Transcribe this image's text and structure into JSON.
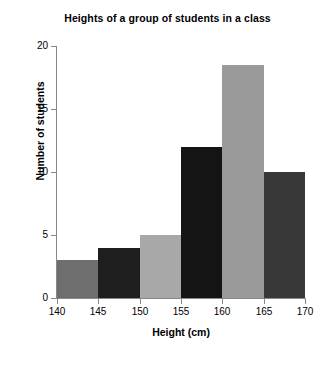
{
  "chart_data": {
    "type": "bar",
    "title": "Heights of a group of students in a class",
    "xlabel": "Height (cm)",
    "ylabel": "Number of students",
    "grid": false,
    "legend": "none",
    "xlim": [
      140,
      170
    ],
    "ylim": [
      0,
      20
    ],
    "xticks": [
      "140",
      "145",
      "150",
      "155",
      "160",
      "165",
      "170"
    ],
    "yticks": [
      "0",
      "5",
      "10",
      "15",
      "20"
    ],
    "bin_width": 5,
    "categories": [
      "140-145",
      "145-150",
      "150-155",
      "155-160",
      "160-165",
      "165-170"
    ],
    "values": [
      3,
      4,
      5,
      12,
      18.5,
      10
    ],
    "bin_edges": [
      140,
      145,
      150,
      155,
      160,
      165,
      170
    ],
    "bar_colors": [
      "#6e6e6e",
      "#1e1e1e",
      "#a8a8a8",
      "#141414",
      "#9a9a9a",
      "#383838"
    ],
    "bars": [
      {
        "label": "140-145",
        "start": 140,
        "end": 145,
        "value": 3,
        "color": "#6e6e6e"
      },
      {
        "label": "145-150",
        "start": 145,
        "end": 150,
        "value": 4,
        "color": "#1e1e1e"
      },
      {
        "label": "150-155",
        "start": 150,
        "end": 155,
        "value": 5,
        "color": "#a8a8a8"
      },
      {
        "label": "155-160",
        "start": 155,
        "end": 160,
        "value": 12,
        "color": "#141414"
      },
      {
        "label": "160-165",
        "start": 160,
        "end": 165,
        "value": 18.5,
        "color": "#9a9a9a"
      },
      {
        "label": "165-170",
        "start": 165,
        "end": 170,
        "value": 10,
        "color": "#383838"
      }
    ]
  },
  "axis": {
    "line_color": "#888888",
    "text_color": "#000000"
  },
  "background": "#ffffff"
}
